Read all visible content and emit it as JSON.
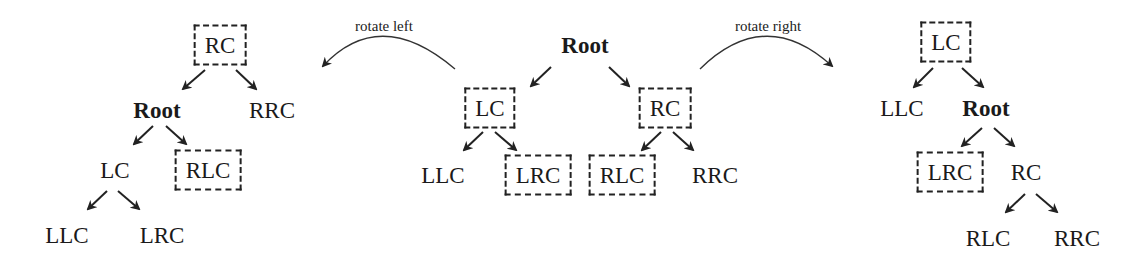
{
  "diagram": {
    "captions": {
      "rotate_left": "rotate left",
      "rotate_right": "rotate right"
    },
    "trees": {
      "left_rotated": {
        "description": "Result after rotate left",
        "nodes": [
          {
            "id": "RC",
            "label": "RC",
            "boxed": true,
            "bold": false,
            "x": 220,
            "y": 45
          },
          {
            "id": "Root",
            "label": "Root",
            "boxed": false,
            "bold": true,
            "x": 157,
            "y": 110
          },
          {
            "id": "RRC",
            "label": "RRC",
            "boxed": false,
            "bold": false,
            "x": 272,
            "y": 110
          },
          {
            "id": "LC",
            "label": "LC",
            "boxed": false,
            "bold": false,
            "x": 115,
            "y": 170
          },
          {
            "id": "RLC",
            "label": "RLC",
            "boxed": true,
            "bold": false,
            "x": 208,
            "y": 170
          },
          {
            "id": "LLC",
            "label": "LLC",
            "boxed": false,
            "bold": false,
            "x": 67,
            "y": 235
          },
          {
            "id": "LRC",
            "label": "LRC",
            "boxed": false,
            "bold": false,
            "x": 162,
            "y": 235
          }
        ],
        "edges": [
          [
            "RC",
            "Root"
          ],
          [
            "RC",
            "RRC"
          ],
          [
            "Root",
            "LC"
          ],
          [
            "Root",
            "RLC"
          ],
          [
            "LC",
            "LLC"
          ],
          [
            "LC",
            "LRC"
          ]
        ]
      },
      "original": {
        "description": "Original tree",
        "nodes": [
          {
            "id": "Root",
            "label": "Root",
            "boxed": false,
            "bold": true,
            "x": 585,
            "y": 45
          },
          {
            "id": "LC",
            "label": "LC",
            "boxed": true,
            "bold": false,
            "x": 490,
            "y": 108
          },
          {
            "id": "RC",
            "label": "RC",
            "boxed": true,
            "bold": false,
            "x": 665,
            "y": 108
          },
          {
            "id": "LLC",
            "label": "LLC",
            "boxed": false,
            "bold": false,
            "x": 443,
            "y": 175
          },
          {
            "id": "LRC",
            "label": "LRC",
            "boxed": true,
            "bold": false,
            "x": 538,
            "y": 175
          },
          {
            "id": "RLC",
            "label": "RLC",
            "boxed": true,
            "bold": false,
            "x": 622,
            "y": 175
          },
          {
            "id": "RRC",
            "label": "RRC",
            "boxed": false,
            "bold": false,
            "x": 715,
            "y": 175
          }
        ],
        "edges": [
          [
            "Root",
            "LC"
          ],
          [
            "Root",
            "RC"
          ],
          [
            "LC",
            "LLC"
          ],
          [
            "LC",
            "LRC"
          ],
          [
            "RC",
            "RLC"
          ],
          [
            "RC",
            "RRC"
          ]
        ]
      },
      "right_rotated": {
        "description": "Result after rotate right",
        "nodes": [
          {
            "id": "LC",
            "label": "LC",
            "boxed": true,
            "bold": false,
            "x": 946,
            "y": 42
          },
          {
            "id": "LLC",
            "label": "LLC",
            "boxed": false,
            "bold": false,
            "x": 902,
            "y": 108
          },
          {
            "id": "Root",
            "label": "Root",
            "boxed": false,
            "bold": true,
            "x": 986,
            "y": 108
          },
          {
            "id": "LRC",
            "label": "LRC",
            "boxed": true,
            "bold": false,
            "x": 950,
            "y": 172
          },
          {
            "id": "RC",
            "label": "RC",
            "boxed": false,
            "bold": false,
            "x": 1026,
            "y": 172
          },
          {
            "id": "RLC",
            "label": "RLC",
            "boxed": false,
            "bold": false,
            "x": 988,
            "y": 238
          },
          {
            "id": "RRC",
            "label": "RRC",
            "boxed": false,
            "bold": false,
            "x": 1077,
            "y": 238
          }
        ],
        "edges": [
          [
            "LC",
            "LLC"
          ],
          [
            "LC",
            "Root"
          ],
          [
            "Root",
            "LRC"
          ],
          [
            "Root",
            "RC"
          ],
          [
            "RC",
            "RLC"
          ],
          [
            "RC",
            "RRC"
          ]
        ]
      }
    },
    "colors": {
      "stroke": "#222222",
      "text": "#1a1a1a",
      "background": "#ffffff"
    }
  }
}
